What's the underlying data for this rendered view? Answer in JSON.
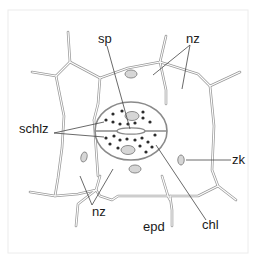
{
  "diagram": {
    "type": "botanical-cell-diagram",
    "labels": [
      {
        "id": "sp",
        "text": "sp",
        "x": 111,
        "y": 43
      },
      {
        "id": "nz-top",
        "text": "nz",
        "x": 186,
        "y": 43
      },
      {
        "id": "schlz",
        "text": "schlz",
        "x": 18,
        "y": 140
      },
      {
        "id": "zk",
        "text": "zk",
        "x": 232,
        "y": 163
      },
      {
        "id": "nz-bottom",
        "text": "nz",
        "x": 92,
        "y": 215
      },
      {
        "id": "epd",
        "text": "epd",
        "x": 143,
        "y": 230
      },
      {
        "id": "chl",
        "text": "chl",
        "x": 203,
        "y": 227
      }
    ],
    "colors": {
      "background": "#ffffff",
      "cell_wall": "#9a9a9a",
      "cell_wall_inner": "#e6e6e6",
      "leader_line": "#444444",
      "chloroplast": "#2b2b2b",
      "nucleus_fill": "#cfcfcf",
      "frame_border": "#ececec"
    }
  }
}
